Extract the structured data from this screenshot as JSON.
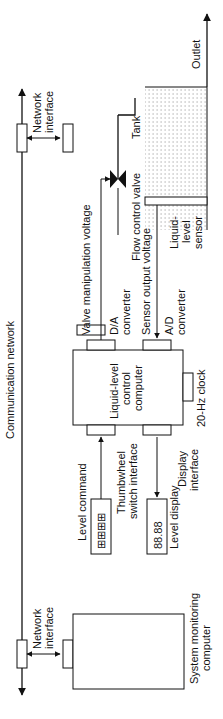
{
  "diagram": {
    "orientation": "rotated -90deg (reads bottom-to-top)",
    "network": {
      "label": "Communication network",
      "interface_label_1": "Network",
      "interface_label_2": "interface"
    },
    "monitor": {
      "line1": "System monitoring",
      "line2": "computer"
    },
    "controller": {
      "line1": "Liquid-level",
      "line2": "control",
      "line3": "computer",
      "clock": "20-Hz clock"
    },
    "da": {
      "line1": "D/A",
      "line2": "converter"
    },
    "ad": {
      "line1": "A/D",
      "line2": "converter"
    },
    "thumbwheel": {
      "line1": "Thumbwheel",
      "line2": "switch interface",
      "input_label": "Level command"
    },
    "display": {
      "line1": "Display",
      "line2": "interface",
      "output_label": "Level display",
      "digits": "88.88"
    },
    "valve_voltage": "Valve manipulation voltage",
    "valve": "Flow control valve",
    "sensor_voltage": "Sensor output voltage",
    "sensor": {
      "line1": "Liquid-",
      "line2": "level",
      "line3": "sensor"
    },
    "tank": "Tank",
    "outlet": "Outlet",
    "colors": {
      "line": "#111111",
      "background": "#ffffff",
      "dots": "#777777"
    }
  }
}
